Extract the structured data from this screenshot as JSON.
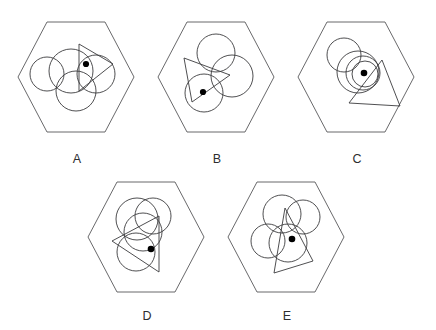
{
  "figure": {
    "background_color": "#ffffff",
    "stroke_color": "#3b3b3d",
    "hex_stroke_color": "#58585a",
    "dot_color": "#000000",
    "panel_count": 5
  },
  "panels": [
    {
      "id": "A",
      "label": "A",
      "label_x": 77,
      "label_y": 163,
      "hexagon": {
        "cx": 76,
        "cy": 77,
        "rx": 58,
        "ry": 64,
        "points": "18,77 47,22 105,22 134,77 105,132 47,132"
      },
      "circles": [
        {
          "cx": 47,
          "cy": 74,
          "r": 17
        },
        {
          "cx": 71,
          "cy": 71,
          "r": 22
        },
        {
          "cx": 96,
          "cy": 74,
          "r": 19
        },
        {
          "cx": 76,
          "cy": 91,
          "r": 20
        }
      ],
      "triangle": {
        "points": "79,44 113,64 79,91"
      },
      "dot": {
        "cx": 86,
        "cy": 64,
        "r": 3.1
      }
    },
    {
      "id": "B",
      "label": "B",
      "label_x": 217,
      "label_y": 163,
      "hexagon": {
        "cx": 216,
        "cy": 77,
        "rx": 58,
        "ry": 64,
        "points": "158,77 187,22 245,22 274,77 245,132 187,132"
      },
      "circles": [
        {
          "cx": 216,
          "cy": 53,
          "r": 19
        },
        {
          "cx": 232,
          "cy": 76,
          "r": 21
        },
        {
          "cx": 204,
          "cy": 93,
          "r": 19
        }
      ],
      "triangle": {
        "points": "184,58 230,75 192,102"
      },
      "dot": {
        "cx": 203,
        "cy": 92,
        "r": 3.1
      }
    },
    {
      "id": "C",
      "label": "C",
      "label_x": 357,
      "label_y": 163,
      "hexagon": {
        "cx": 356,
        "cy": 77,
        "rx": 58,
        "ry": 64,
        "points": "298,77 327,22 385,22 414,77 385,132 327,132"
      },
      "circles": [
        {
          "cx": 344,
          "cy": 55,
          "r": 17
        },
        {
          "cx": 358,
          "cy": 72,
          "r": 21
        },
        {
          "cx": 363,
          "cy": 73,
          "r": 17
        },
        {
          "cx": 365,
          "cy": 74,
          "r": 13
        }
      ],
      "triangle": {
        "points": "382,60 400,106 349,103"
      },
      "dot": {
        "cx": 364,
        "cy": 73,
        "r": 3.3
      }
    },
    {
      "id": "D",
      "label": "D",
      "label_x": 147,
      "label_y": 320,
      "hexagon": {
        "cx": 146,
        "cy": 237,
        "rx": 58,
        "ry": 64,
        "points": "88,237 117,182 175,182 204,237 175,292 117,292"
      },
      "circles": [
        {
          "cx": 137,
          "cy": 219,
          "r": 21
        },
        {
          "cx": 153,
          "cy": 216,
          "r": 18
        },
        {
          "cx": 143,
          "cy": 232,
          "r": 19
        },
        {
          "cx": 136,
          "cy": 252,
          "r": 19
        }
      ],
      "triangle": {
        "points": "159,216 159,272 112,241"
      },
      "dot": {
        "cx": 151,
        "cy": 249,
        "r": 3.3
      }
    },
    {
      "id": "E",
      "label": "E",
      "label_x": 287,
      "label_y": 320,
      "hexagon": {
        "cx": 286,
        "cy": 237,
        "rx": 58,
        "ry": 64,
        "points": "228,237 257,182 315,182 344,237 315,292 257,292"
      },
      "circles": [
        {
          "cx": 282,
          "cy": 214,
          "r": 19
        },
        {
          "cx": 303,
          "cy": 217,
          "r": 17
        },
        {
          "cx": 268,
          "cy": 241,
          "r": 17
        },
        {
          "cx": 288,
          "cy": 243,
          "r": 19
        }
      ],
      "triangle": {
        "points": "285,208 313,261 274,273"
      },
      "dot": {
        "cx": 292,
        "cy": 239,
        "r": 3.3
      }
    }
  ]
}
